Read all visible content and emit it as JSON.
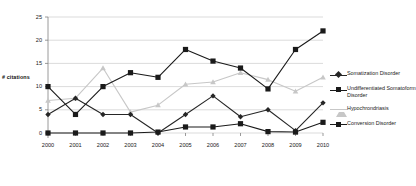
{
  "chart_data": {
    "type": "line",
    "title": "",
    "xlabel": "",
    "ylabel": "# citations",
    "categories": [
      "2000",
      "2001",
      "2002",
      "2003",
      "2004",
      "2005",
      "2006",
      "2007",
      "2008",
      "2009",
      "2010"
    ],
    "x": [
      2000,
      2001,
      2002,
      2003,
      2004,
      2005,
      2006,
      2007,
      2008,
      2009,
      2010
    ],
    "ylim": [
      0,
      25
    ],
    "yticks": [
      0,
      5,
      10,
      15,
      20,
      25
    ],
    "grid": true,
    "legend_position": "right",
    "series": [
      {
        "name": "Somatization Disorder",
        "color": "#262626",
        "marker": "diamond",
        "values": [
          4,
          7.5,
          4,
          4,
          0,
          4,
          8,
          3.5,
          5,
          0.5,
          6.5
        ]
      },
      {
        "name": "Undifferentiated Somatoform Disorder",
        "color": "#1a1a1a",
        "marker": "square",
        "values": [
          10,
          4,
          10,
          13,
          12,
          18,
          15.5,
          14,
          9.5,
          18,
          22
        ]
      },
      {
        "name": "Hypochrondriasis",
        "color": "#c7c7c7",
        "marker": "triangle",
        "values": [
          7,
          7.5,
          14,
          4.5,
          6,
          10.5,
          11,
          13,
          11.5,
          9,
          12
        ]
      },
      {
        "name": "Conversion Disorder",
        "color": "#1a1a1a",
        "marker": "square",
        "values": [
          0,
          0,
          0,
          0,
          0.2,
          1.3,
          1.3,
          2,
          0.3,
          0.2,
          2.3
        ]
      }
    ]
  },
  "axes": {
    "y_tick_labels": [
      "0",
      "5",
      "10",
      "15",
      "20",
      "25"
    ],
    "x_tick_labels": [
      "2000",
      "2001",
      "2002",
      "2003",
      "2004",
      "2005",
      "2006",
      "2007",
      "2008",
      "2009",
      "2010"
    ],
    "y_axis_title": "# citations"
  },
  "legend": {
    "items": [
      {
        "label": "Somatization Disorder"
      },
      {
        "label": "Undifferentiated Somatoform Disorder"
      },
      {
        "label": "Hypochrondriasis"
      },
      {
        "label": "Conversion Disorder"
      }
    ]
  },
  "colors": {
    "grid": "#d2d2d2",
    "axis": "#808080",
    "dark": "#1a1a1a",
    "light_gray": "#c7c7c7",
    "background": "#ffffff"
  }
}
